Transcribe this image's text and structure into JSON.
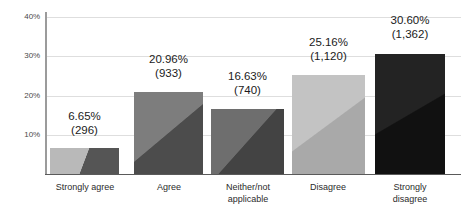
{
  "chart_data": {
    "type": "bar",
    "title": "",
    "subtitle": "",
    "xlabel": "",
    "ylabel": "",
    "ylim": [
      0,
      40
    ],
    "grid": true,
    "legend": "none",
    "categories": [
      "Strongly agree",
      "Agree",
      "Neither/not applicable",
      "Disagree",
      "Strongly disagree"
    ],
    "category_lines": [
      [
        "Strongly agree"
      ],
      [
        "Agree"
      ],
      [
        "Neither/not",
        "applicable"
      ],
      [
        "Disagree"
      ],
      [
        "Strongly",
        "disagree"
      ]
    ],
    "values": [
      6.65,
      20.96,
      16.63,
      25.16,
      30.6
    ],
    "counts": [
      296,
      933,
      740,
      1120,
      1362
    ],
    "value_labels": [
      "6.65%",
      "20.96%",
      "16.63%",
      "25.16%",
      "30.60%"
    ],
    "count_labels": [
      "(296)",
      "(933)",
      "(740)",
      "(1,120)",
      "(1,362)"
    ],
    "ytick_labels": [
      "10%",
      "20%",
      "30%",
      "40%"
    ],
    "ytick_values": [
      10,
      20,
      30,
      40
    ],
    "bar_colors_light": [
      "#b9b9b9",
      "#7d7d7d",
      "#6e6e6e",
      "#c3c3c3",
      "#232323"
    ],
    "bar_colors_dark": [
      "#555555",
      "#4c4c4c",
      "#434343",
      "#a9a9a9",
      "#111111"
    ],
    "axis_color": "#9b9b9b",
    "grid_color": "#dedede",
    "baseline_color": "#5a5a5a",
    "text_color": "#1b1b1b"
  }
}
